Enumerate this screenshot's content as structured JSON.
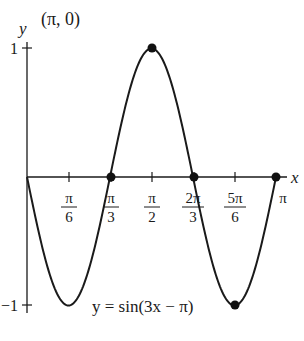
{
  "chart_data": {
    "type": "line",
    "title": "",
    "function_label": "y = sin(3x − π)",
    "xlabel": "x",
    "ylabel": "y",
    "xlim": [
      0,
      3.14159
    ],
    "ylim": [
      -1,
      1
    ],
    "grid": false,
    "x_ticks": [
      "π/6",
      "π/3",
      "π/2",
      "2π/3",
      "5π/6",
      "π"
    ],
    "y_ticks": [
      "1",
      "−1"
    ],
    "annotations": [
      "(π, 0)"
    ],
    "marked_points": [
      {
        "x": "π/3",
        "y": 0
      },
      {
        "x": "π/2",
        "y": 1
      },
      {
        "x": "2π/3",
        "y": 0
      },
      {
        "x": "5π/6",
        "y": -1
      },
      {
        "x": "π",
        "y": 0
      }
    ],
    "series": [
      {
        "name": "y = sin(3x − π)",
        "x": [
          0,
          0.5236,
          1.0472,
          1.5708,
          2.0944,
          2.618,
          3.1416
        ],
        "values": [
          0,
          -1,
          0,
          1,
          0,
          -1,
          0
        ]
      }
    ]
  },
  "labels": {
    "y_axis": "y",
    "x_axis": "x",
    "point_annotation": "(π, 0)",
    "y_tick_top": "1",
    "y_tick_bottom": "−1",
    "equation": "y = sin(3x − π)",
    "ticks": [
      {
        "num": "π",
        "den": "6"
      },
      {
        "num": "π",
        "den": "3"
      },
      {
        "num": "π",
        "den": "2"
      },
      {
        "num": "2π",
        "den": "3"
      },
      {
        "num": "5π",
        "den": "6"
      }
    ],
    "tick_pi": "π"
  }
}
